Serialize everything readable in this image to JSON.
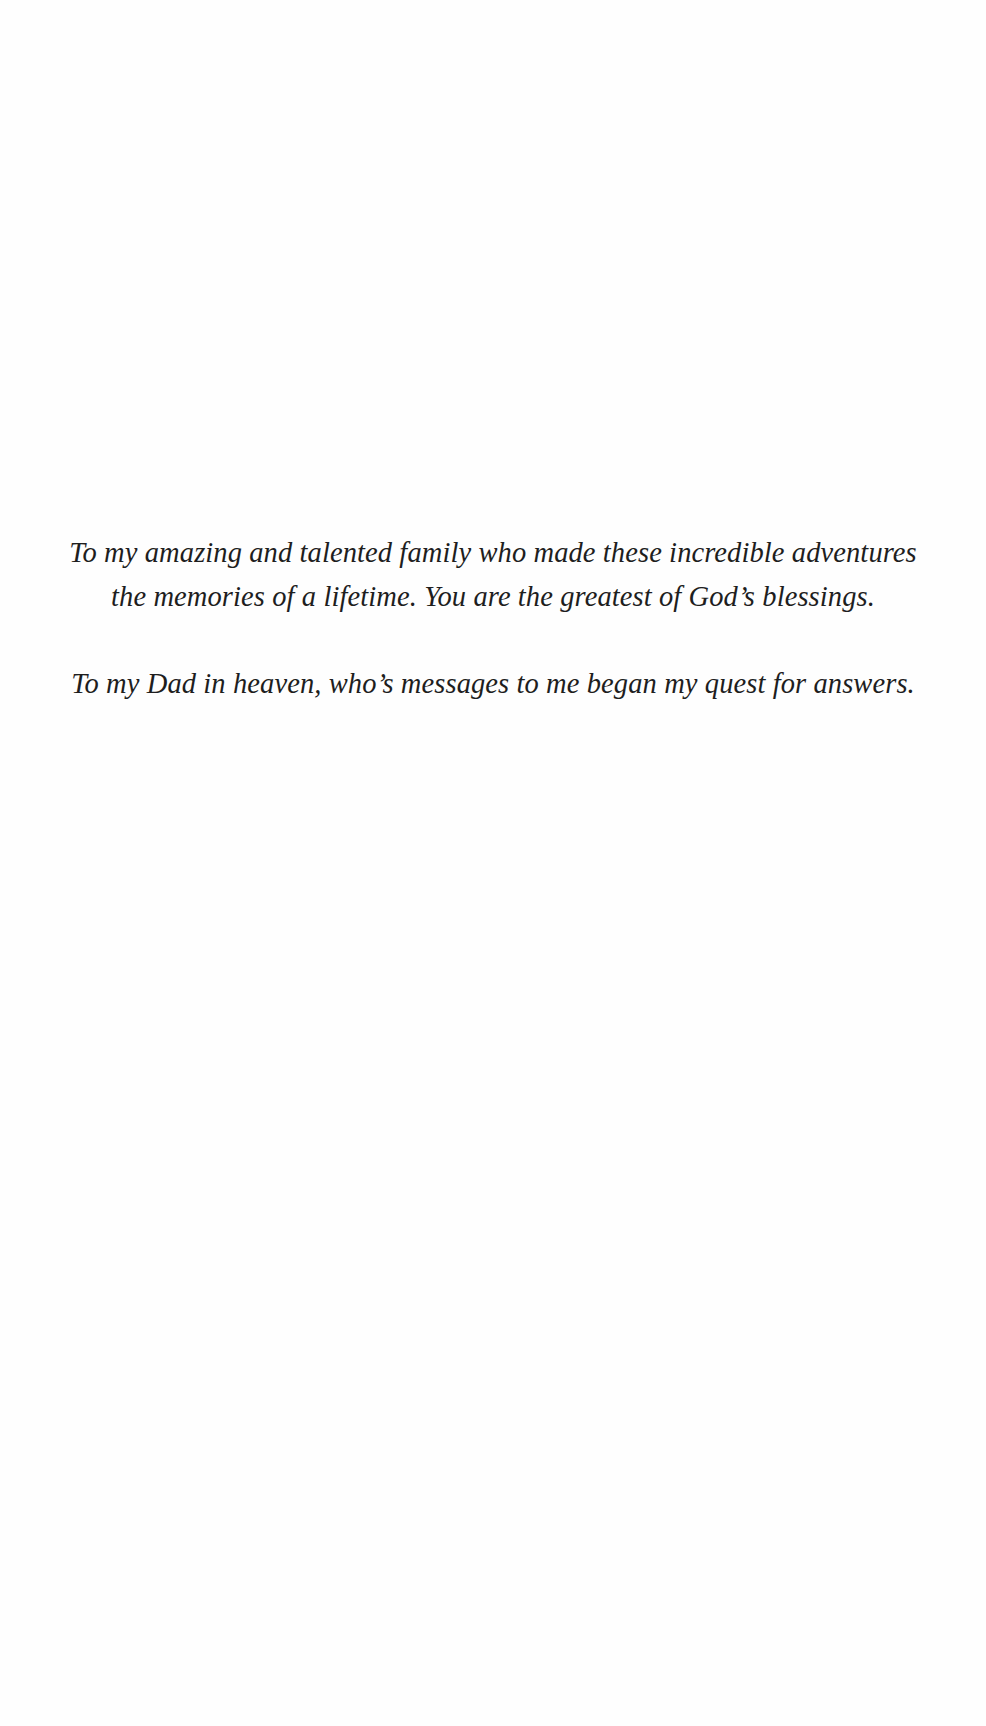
{
  "page": {
    "background": "#fefefe",
    "text_color": "#1e1e1e"
  },
  "dedication": {
    "paragraphs": [
      {
        "lines": [
          "To my amazing and talented family who made these incredible adventures",
          "the memories of a lifetime. You are the greatest of God’s blessings."
        ]
      },
      {
        "lines": [
          "To my Dad in heaven, who’s messages to me began my quest for answers."
        ]
      }
    ]
  }
}
